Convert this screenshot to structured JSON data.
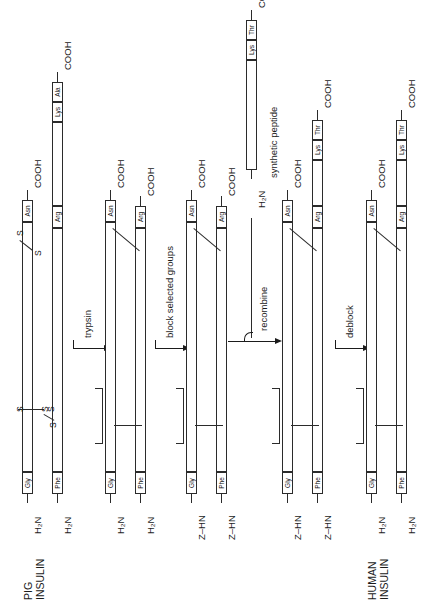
{
  "figure": {
    "title_hidden": "Semisynthesis of human insulin from pig insulin",
    "orientation": "rotated-90-ccw",
    "ink_color": "#1b1b1b",
    "paper_color": "#ffffff"
  },
  "labels": {
    "pig_insulin": "PIG\nINSULIN",
    "pig_insulin_line1": "PIG",
    "pig_insulin_line2": "INSULIN",
    "human_insulin_line1": "HUMAN",
    "human_insulin_line2": "INSULIN",
    "synthetic_peptide": "synthetic peptide",
    "amino_free": "H₂N",
    "amino_blocked": "Z–HN",
    "carboxyl": "COOH",
    "sulfur": "S",
    "residue_gly": "Gly",
    "residue_phe": "Phe",
    "residue_asn": "Asn",
    "residue_arg": "Arg",
    "residue_lys": "Lys",
    "residue_ala": "Ala",
    "residue_thr": "Thr"
  },
  "steps": [
    {
      "id": "trypsin",
      "label": "trypsin"
    },
    {
      "id": "block",
      "label": "block selected groups"
    },
    {
      "id": "recombine",
      "label": "recombine"
    },
    {
      "id": "deblock",
      "label": "deblock"
    }
  ],
  "columns": [
    {
      "id": "pig-insulin",
      "caption_line1": "PIG",
      "caption_line2": "INSULIN",
      "chains": [
        {
          "id": "a-chain",
          "n_terminus": "H₂N",
          "n_residue": "Gly",
          "c_terminus": "COOH",
          "c_residue": "Asn"
        },
        {
          "id": "b-chain",
          "n_terminus": "H₂N",
          "n_residue": "Phe",
          "c_terminus": "COOH",
          "mid_residue": "Arg",
          "c_residues": [
            "Lys",
            "Ala"
          ]
        }
      ],
      "disulfides": 2
    },
    {
      "id": "after-trypsin",
      "caption_line1": "",
      "caption_line2": "",
      "chains": [
        {
          "id": "a-chain",
          "n_terminus": "H₂N",
          "n_residue": "Gly",
          "c_terminus": "COOH",
          "c_residue": "Asn"
        },
        {
          "id": "des-octapeptide-b-chain",
          "n_terminus": "H₂N",
          "n_residue": "Phe",
          "c_terminus": "COOH",
          "c_residue": "Arg"
        }
      ]
    },
    {
      "id": "after-block",
      "caption_line1": "",
      "caption_line2": "",
      "chains": [
        {
          "id": "a-chain",
          "n_terminus": "Z–HN",
          "n_residue": "Gly",
          "c_terminus": "COOH",
          "c_residue": "Asn"
        },
        {
          "id": "des-octapeptide-b-chain",
          "n_terminus": "Z–HN",
          "n_residue": "Phe",
          "c_terminus": "COOH",
          "c_residue": "Arg"
        }
      ]
    },
    {
      "id": "after-recombine",
      "caption_line1": "",
      "caption_line2": "",
      "chains": [
        {
          "id": "a-chain",
          "n_terminus": "Z–HN",
          "n_residue": "Gly",
          "c_terminus": "COOH",
          "c_residue": "Asn"
        },
        {
          "id": "b-chain",
          "n_terminus": "Z–HN",
          "n_residue": "Phe",
          "c_terminus": "COOH",
          "mid_residue": "Arg",
          "c_residues": [
            "Lys",
            "Thr"
          ]
        }
      ]
    },
    {
      "id": "human-insulin",
      "caption_line1": "HUMAN",
      "caption_line2": "INSULIN",
      "chains": [
        {
          "id": "a-chain",
          "n_terminus": "H₂N",
          "n_residue": "Gly",
          "c_terminus": "COOH",
          "c_residue": "Asn"
        },
        {
          "id": "b-chain",
          "n_terminus": "H₂N",
          "n_residue": "Phe",
          "c_terminus": "COOH",
          "mid_residue": "Arg",
          "c_residues": [
            "Lys",
            "Thr"
          ]
        }
      ]
    }
  ],
  "synthetic_peptide": {
    "id": "synthetic-peptide",
    "n_terminus": "H₂N",
    "c_terminus": "COOH",
    "c_residues": [
      "Lys",
      "Thr"
    ],
    "caption": "synthetic peptide"
  }
}
